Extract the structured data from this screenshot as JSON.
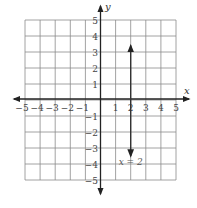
{
  "chart_data": {
    "type": "line",
    "title": "",
    "xlabel": "x",
    "ylabel": "y",
    "xlim": [
      -5,
      5
    ],
    "ylim": [
      -5,
      5
    ],
    "grid": true,
    "x_ticks": [
      -5,
      -4,
      -3,
      -2,
      -1,
      1,
      2,
      3,
      4,
      5
    ],
    "y_ticks": [
      -5,
      -4,
      -3,
      -2,
      -1,
      1,
      2,
      3,
      4,
      5
    ],
    "x_tick_labels": [
      "−5",
      "−4",
      "−3",
      "−2",
      "−1",
      "1",
      "2",
      "3",
      "4",
      "5"
    ],
    "y_tick_labels": [
      "−5",
      "−4",
      "−3",
      "−2",
      "−1",
      "1",
      "2",
      "3",
      "4",
      "5"
    ],
    "series": [
      {
        "name": "x = 2",
        "kind": "vertical-line",
        "x": [
          2,
          2
        ],
        "y": [
          -3.5,
          3.4
        ],
        "arrows": "both"
      }
    ],
    "annotations": [
      {
        "text": "x = 2",
        "x": 2,
        "y": -3.9
      }
    ]
  },
  "labels": {
    "x_axis": "x",
    "y_axis": "y",
    "equation": "x = 2"
  },
  "colors": {
    "grid": "#8a8a8a",
    "axis": "#222222",
    "line": "#333333"
  }
}
